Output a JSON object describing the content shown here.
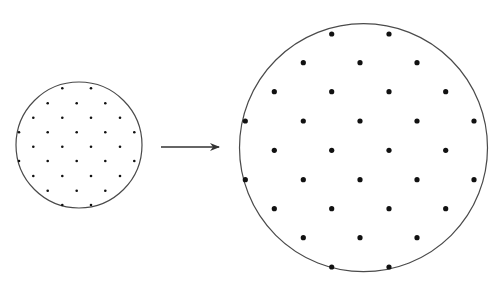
{
  "diagram": {
    "colors": {
      "outline": "#4a4a4a",
      "dot": "#111111",
      "arrow": "#333333",
      "background": "#ffffff"
    },
    "small_circle": {
      "cx": 79,
      "cy": 145,
      "r": 63,
      "dot_radius": 1.3,
      "rows": [
        {
          "y": 88.3,
          "xs": [
            62.3,
            91
          ]
        },
        {
          "y": 103.3,
          "xs": [
            47.7,
            76.7,
            105.3
          ]
        },
        {
          "y": 117.7,
          "xs": [
            33.3,
            62.3,
            91,
            120
          ]
        },
        {
          "y": 132.3,
          "xs": [
            19,
            47.7,
            76.7,
            105.3,
            134.3
          ]
        },
        {
          "y": 146.7,
          "xs": [
            33.3,
            62.3,
            91,
            120
          ]
        },
        {
          "y": 161,
          "xs": [
            19,
            47.7,
            76.7,
            105.3,
            134.3
          ]
        },
        {
          "y": 176,
          "xs": [
            33.3,
            62.3,
            91,
            120
          ]
        },
        {
          "y": 190.7,
          "xs": [
            47.7,
            76.7,
            105.3
          ]
        },
        {
          "y": 205,
          "xs": [
            62.3,
            91
          ]
        }
      ]
    },
    "arrow": {
      "x1": 161,
      "y1": 147,
      "x2": 219,
      "y2": 147,
      "direction": "right"
    },
    "large_circle": {
      "cx": 363.5,
      "cy": 147.7,
      "r": 124,
      "dot_radius": 2.6,
      "rows": [
        {
          "y": 34,
          "xs": [
            331.7,
            389
          ]
        },
        {
          "y": 62.7,
          "xs": [
            303.3,
            360,
            417
          ]
        },
        {
          "y": 91.7,
          "xs": [
            274.3,
            331.7,
            389,
            445.7
          ]
        },
        {
          "y": 121,
          "xs": [
            245.3,
            303.3,
            360,
            417,
            474
          ]
        },
        {
          "y": 150.3,
          "xs": [
            274.3,
            331.7,
            389,
            445.7
          ]
        },
        {
          "y": 179.7,
          "xs": [
            245.3,
            303.3,
            360,
            417,
            474
          ]
        },
        {
          "y": 208.7,
          "xs": [
            274.3,
            331.7,
            389,
            445.7
          ]
        },
        {
          "y": 237.7,
          "xs": [
            303.3,
            360,
            417
          ]
        },
        {
          "y": 267,
          "xs": [
            331.7,
            389
          ]
        }
      ]
    }
  }
}
